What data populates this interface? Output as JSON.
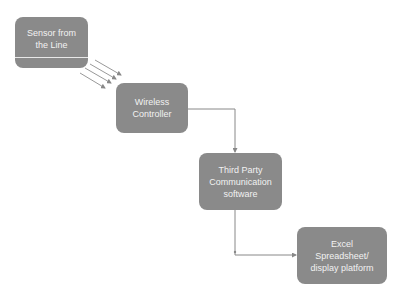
{
  "diagram": {
    "type": "flowchart",
    "nodes": [
      {
        "id": "sensor",
        "label_lines": [
          "Sensor from",
          "the Line"
        ]
      },
      {
        "id": "wireless",
        "label_lines": [
          "Wireless",
          "Controller"
        ]
      },
      {
        "id": "third",
        "label_lines": [
          "Third Party",
          "Communication",
          "software"
        ]
      },
      {
        "id": "excel",
        "label_lines": [
          "Excel",
          "Spreadsheet/",
          "display platform"
        ]
      }
    ],
    "edges": [
      {
        "from": "sensor",
        "to": "wireless",
        "style": "wireless-signal (4 parallel arrows)"
      },
      {
        "from": "wireless",
        "to": "third",
        "style": "elbow connector"
      },
      {
        "from": "third",
        "to": "excel",
        "style": "elbow connector"
      }
    ],
    "colors": {
      "node_fill": "#8a8a8a",
      "node_text": "#f2f2f2",
      "connector": "#888888"
    }
  }
}
